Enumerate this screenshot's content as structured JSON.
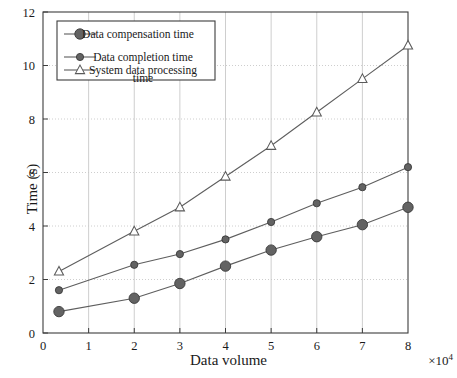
{
  "chart_data": {
    "type": "line",
    "title": "",
    "xlabel": "Data volume",
    "ylabel": "Time (s)",
    "x_multiplier": "×10",
    "x_multiplier_exp": "4",
    "xlim": [
      0,
      8
    ],
    "ylim": [
      0,
      12
    ],
    "xticks": [
      0,
      1,
      2,
      3,
      4,
      5,
      6,
      7,
      8
    ],
    "xtick_labels": [
      "0",
      "1",
      "2",
      "3",
      "4",
      "5",
      "6",
      "7",
      "8"
    ],
    "yticks": [
      0,
      2,
      4,
      6,
      8,
      10,
      12
    ],
    "ytick_labels": [
      "0",
      "2",
      "4",
      "6",
      "8",
      "10",
      "12"
    ],
    "grid": true,
    "legend_position": "upper-left",
    "x": [
      0.35,
      2,
      3,
      4,
      5,
      6,
      7,
      8
    ],
    "series": [
      {
        "name": "Data compensation time",
        "marker": "filled-circle-large",
        "color": "#575757",
        "values": [
          0.8,
          1.3,
          1.85,
          2.5,
          3.1,
          3.6,
          4.05,
          4.7
        ]
      },
      {
        "name": "Data completion time",
        "marker": "filled-circle-small",
        "color": "#575757",
        "values": [
          1.6,
          2.55,
          2.95,
          3.5,
          4.15,
          4.85,
          5.45,
          6.2
        ]
      },
      {
        "name": "System data processing time",
        "marker": "open-triangle",
        "color": "#6b6b6b",
        "values": [
          2.3,
          3.8,
          4.7,
          5.85,
          7.0,
          8.25,
          9.5,
          10.75
        ]
      }
    ]
  },
  "legend": {
    "entries": [
      {
        "label": "Data compensation time"
      },
      {
        "label": "Data completion time"
      },
      {
        "label": "System data processing"
      },
      {
        "label": "time"
      }
    ]
  },
  "colors": {
    "axis": "#3c3c3c",
    "grid": "#c8c8c8",
    "line": "#5e5e5e",
    "marker_fill": "#636363",
    "marker_edge": "#3a3a3a",
    "background": "#ffffff"
  }
}
